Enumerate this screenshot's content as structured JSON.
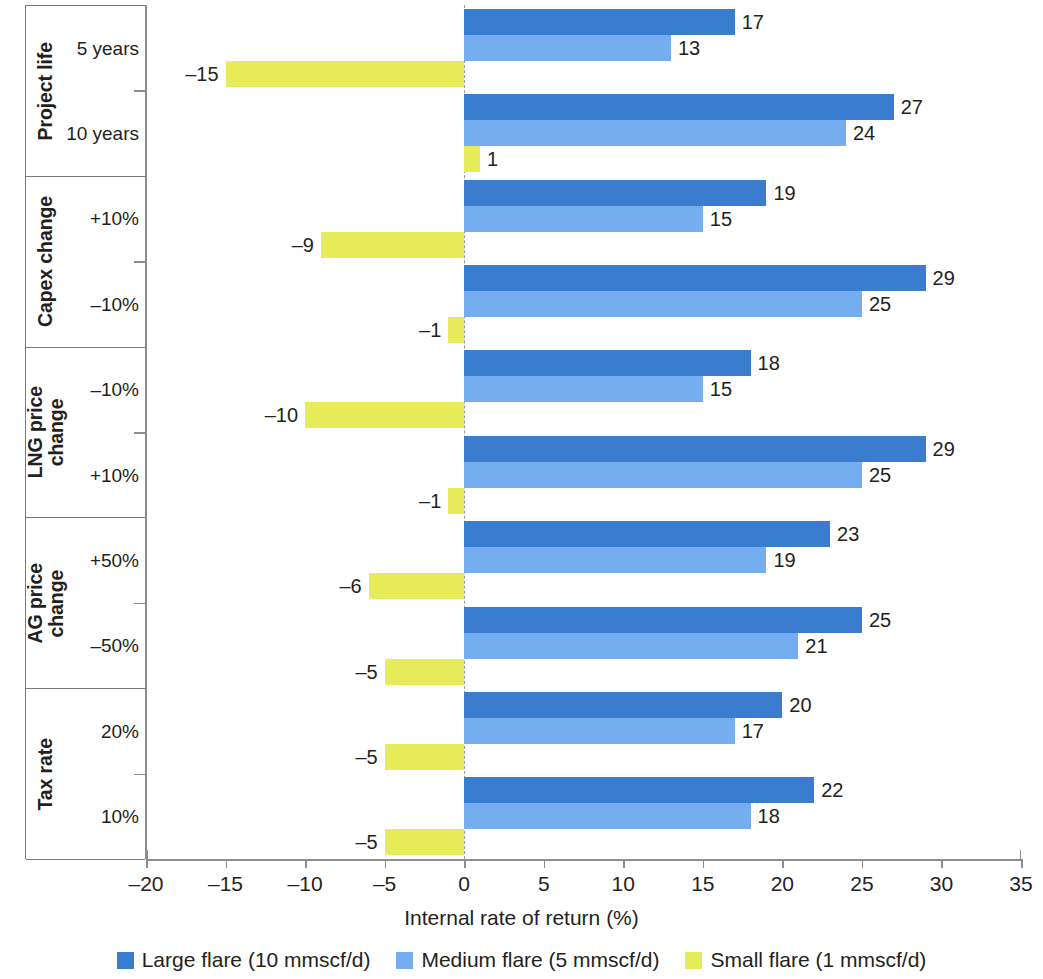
{
  "chart_data": {
    "type": "bar",
    "orientation": "horizontal",
    "title": "",
    "xlabel": "Internal rate of return (%)",
    "ylabel": "",
    "xlim": [
      -20,
      35
    ],
    "xticks": [
      -20,
      -15,
      -10,
      -5,
      0,
      5,
      10,
      15,
      20,
      25,
      30,
      35
    ],
    "xtick_labels": [
      "–20",
      "–15",
      "–10",
      "–5",
      "0",
      "5",
      "10",
      "15",
      "20",
      "25",
      "30",
      "35"
    ],
    "grid": false,
    "legend_position": "bottom",
    "series": [
      {
        "name": "Large flare (10 mmscf/d)",
        "color": "#3a7ccd",
        "values": [
          17,
          27,
          19,
          29,
          18,
          29,
          23,
          25,
          20,
          22
        ],
        "labels": [
          "17",
          "27",
          "19",
          "29",
          "18",
          "29",
          "23",
          "25",
          "20",
          "22"
        ]
      },
      {
        "name": "Medium flare (5 mmscf/d)",
        "color": "#74aef0",
        "values": [
          13,
          24,
          15,
          25,
          15,
          25,
          19,
          21,
          17,
          18
        ],
        "labels": [
          "13",
          "24",
          "15",
          "25",
          "15",
          "25",
          "19",
          "21",
          "17",
          "18"
        ]
      },
      {
        "name": "Small flare (1 mmscf/d)",
        "color": "#e7ec5b",
        "values": [
          -15,
          1,
          -9,
          -1,
          -10,
          -1,
          -6,
          -5,
          -5,
          -5
        ],
        "labels": [
          "–15",
          "1",
          "–9",
          "–1",
          "–10",
          "–1",
          "–6",
          "–5",
          "–5",
          "–5"
        ]
      }
    ],
    "groups": [
      {
        "title": "Project life",
        "title_lines": "Project life",
        "categories": [
          "5 years",
          "10 years"
        ]
      },
      {
        "title": "Capex change",
        "title_lines": "Capex change",
        "categories": [
          "+10%",
          "–10%"
        ]
      },
      {
        "title": "LNG price change",
        "title_lines": "LNG price\nchange",
        "categories": [
          "–10%",
          "+10%"
        ]
      },
      {
        "title": "AG price change",
        "title_lines": "AG price\nchange",
        "categories": [
          "+50%",
          "–50%"
        ]
      },
      {
        "title": "Tax rate",
        "title_lines": "Tax rate",
        "categories": [
          "20%",
          "10%"
        ]
      }
    ],
    "categories": [
      "Project life / 5 years",
      "Project life / 10 years",
      "Capex change / +10%",
      "Capex change / –10%",
      "LNG price change / –10%",
      "LNG price change / +10%",
      "AG price change / +50%",
      "AG price change / –50%",
      "Tax rate / 20%",
      "Tax rate / 10%"
    ]
  },
  "legend": {
    "items": [
      {
        "label": "Large flare (10 mmscf/d)",
        "color": "#3a7ccd"
      },
      {
        "label": "Medium flare (5 mmscf/d)",
        "color": "#74aef0"
      },
      {
        "label": "Small flare (1 mmscf/d)",
        "color": "#e7ec5b"
      }
    ]
  },
  "axis": {
    "x_title": "Internal rate of return (%)"
  }
}
